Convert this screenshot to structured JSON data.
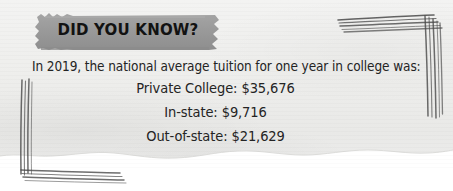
{
  "card": {
    "banner_label": "DID YOU KNOW?",
    "lead_line": "In 2019, the national average tuition for one year in college was:",
    "stats": [
      {
        "label": "Private College",
        "value": "$35,676",
        "text": "Private College: $35,676"
      },
      {
        "label": "In-state",
        "value": "$9,716",
        "text": "In-state: $9,716"
      },
      {
        "label": "Out-of-state",
        "value": "$21,629",
        "text": "Out-of-state: $21,629"
      }
    ],
    "colors": {
      "paper": "#eeeeec",
      "banner_fill": "#9a9a9a",
      "banner_text": "#121212",
      "body_text": "#242424",
      "bracket_ink": "#4a4a4a",
      "page_background": "#ffffff"
    },
    "decorations": {
      "top_right_bracket": "hand-drawn-corner-bracket",
      "bottom_left_bracket": "hand-drawn-corner-bracket",
      "banner_shape": "brush-stroke-highlight",
      "paper_edge": "torn-paper-edge"
    }
  }
}
